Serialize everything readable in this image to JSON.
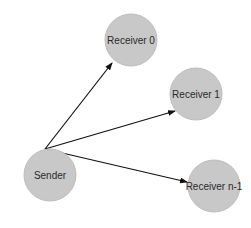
{
  "diagram": {
    "type": "broadcast",
    "colors": {
      "node_fill": "#c8c8c8",
      "edge": "#111111",
      "text": "#2a2a2a"
    },
    "nodes": [
      {
        "id": "sender",
        "label": "Sender",
        "cx": 50,
        "cy": 175,
        "r": 26
      },
      {
        "id": "r0",
        "label": "Receiver 0",
        "cx": 131,
        "cy": 40,
        "r": 26
      },
      {
        "id": "r1",
        "label": "Receiver 1",
        "cx": 196,
        "cy": 94,
        "r": 26
      },
      {
        "id": "rn1",
        "label": "Receiver n-1",
        "cx": 214,
        "cy": 186,
        "r": 26
      }
    ],
    "edges": [
      {
        "from": "Sender",
        "to": "Receiver 0"
      },
      {
        "from": "Sender",
        "to": "Receiver 1"
      },
      {
        "from": "Sender",
        "to": "Receiver n-1"
      }
    ]
  }
}
